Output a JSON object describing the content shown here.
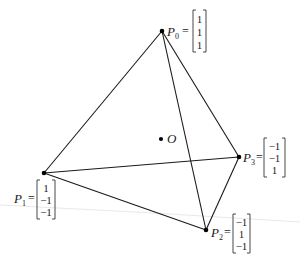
{
  "diagram": {
    "colors": {
      "stroke": "#1a1a1a",
      "background": "#ffffff"
    },
    "center": {
      "label": "O",
      "x": 161,
      "y": 139
    },
    "vertices": [
      {
        "id": "P0",
        "name": "P",
        "sub": "0",
        "x": 162,
        "y": 31,
        "vector": [
          "1",
          "1",
          "1"
        ]
      },
      {
        "id": "P1",
        "name": "P",
        "sub": "1",
        "x": 44,
        "y": 173,
        "vector": [
          "1",
          "−1",
          "−1"
        ]
      },
      {
        "id": "P2",
        "name": "P",
        "sub": "2",
        "x": 206,
        "y": 230,
        "vector": [
          "−1",
          "1",
          "−1"
        ]
      },
      {
        "id": "P3",
        "name": "P",
        "sub": "3",
        "x": 239,
        "y": 157,
        "vector": [
          "−1",
          "−1",
          "1"
        ]
      }
    ],
    "edges": [
      [
        "P0",
        "P1"
      ],
      [
        "P0",
        "P2"
      ],
      [
        "P0",
        "P3"
      ],
      [
        "P1",
        "P2"
      ],
      [
        "P1",
        "P3"
      ],
      [
        "P2",
        "P3"
      ]
    ],
    "equals": "="
  }
}
